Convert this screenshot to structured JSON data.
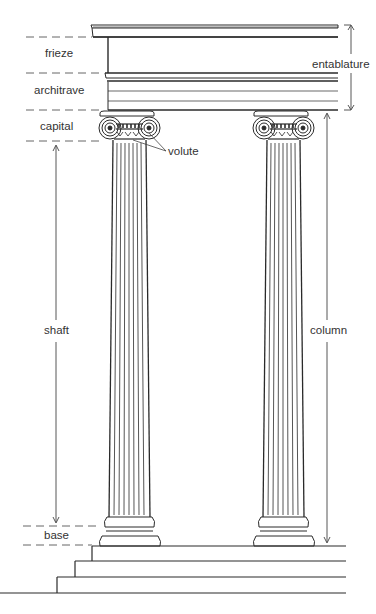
{
  "labels": {
    "frieze": "frieze",
    "architrave": "architrave",
    "capital": "capital",
    "volute": "volute",
    "shaft": "shaft",
    "base": "base",
    "entablature": "entablature",
    "column": "column"
  },
  "colors": {
    "line": "#2a2a2a",
    "dash": "#555555",
    "text": "#333333",
    "background": "#ffffff"
  }
}
